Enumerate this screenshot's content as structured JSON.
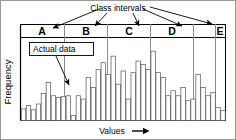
{
  "figure": {
    "title_annotation": "Class intervals",
    "data_annotation": "Actual data",
    "ylabel": "Frequency",
    "xlabel": "Values",
    "xlabel_arrow": "arrow-right-icon",
    "class_labels": [
      "A",
      "B",
      "C",
      "D",
      "E"
    ],
    "colors": {
      "line": "#000000",
      "bar_outline": "#555555",
      "background": "#ffffff",
      "divider": "#888888"
    }
  },
  "chart_data": {
    "type": "bar",
    "title": "Class intervals",
    "xlabel": "Values",
    "ylabel": "Frequency",
    "grid": false,
    "legend": null,
    "ylim": [
      0,
      100
    ],
    "annotations": [
      {
        "text": "Class intervals",
        "points_to": [
          "A",
          "B",
          "C",
          "D",
          "E"
        ]
      },
      {
        "text": "Actual data",
        "points_to": "individual-bar"
      }
    ],
    "class_intervals": [
      {
        "label": "A",
        "x_start": 0,
        "x_end": 9
      },
      {
        "label": "B",
        "x_start": 9,
        "x_end": 18
      },
      {
        "label": "C",
        "x_start": 18,
        "x_end": 27
      },
      {
        "label": "D",
        "x_start": 27,
        "x_end": 36
      },
      {
        "label": "E",
        "x_start": 36,
        "x_end": 41
      }
    ],
    "categories": [
      "1",
      "2",
      "3",
      "4",
      "5",
      "6",
      "7",
      "8",
      "9",
      "10",
      "11",
      "12",
      "13",
      "14",
      "15",
      "16",
      "17",
      "18",
      "19",
      "20",
      "21",
      "22",
      "23",
      "24",
      "25",
      "26",
      "27",
      "28",
      "29",
      "30",
      "31",
      "32",
      "33",
      "34",
      "35",
      "36",
      "37",
      "38",
      "39",
      "40",
      "41"
    ],
    "values": [
      14,
      18,
      13,
      20,
      33,
      46,
      30,
      28,
      29,
      30,
      6,
      30,
      26,
      52,
      40,
      62,
      70,
      56,
      78,
      44,
      60,
      26,
      58,
      72,
      68,
      62,
      84,
      58,
      52,
      30,
      36,
      30,
      40,
      24,
      26,
      56,
      40,
      30,
      34,
      16,
      12
    ]
  }
}
